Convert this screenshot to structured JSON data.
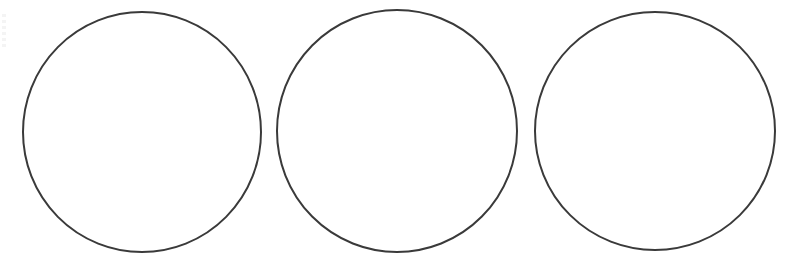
{
  "diagram": {
    "background": "#ffffff",
    "stroke_color": "#3a3a3a",
    "stroke_width": 2,
    "fill": "none",
    "shapes": [
      {
        "type": "circle",
        "cx": 142,
        "cy": 132,
        "rx": 119,
        "ry": 120
      },
      {
        "type": "circle",
        "cx": 397,
        "cy": 131,
        "rx": 120,
        "ry": 121
      },
      {
        "type": "circle",
        "cx": 655,
        "cy": 131,
        "rx": 120,
        "ry": 119
      }
    ]
  }
}
